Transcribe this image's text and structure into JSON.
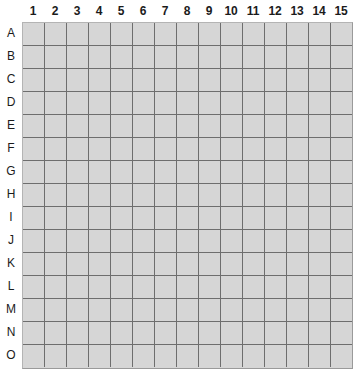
{
  "grid": {
    "title": "",
    "column_headers": [
      "1",
      "2",
      "3",
      "4",
      "5",
      "6",
      "7",
      "8",
      "9",
      "10",
      "11",
      "12",
      "13",
      "14",
      "15"
    ],
    "row_headers": [
      "A",
      "B",
      "C",
      "D",
      "E",
      "F",
      "G",
      "H",
      "I",
      "J",
      "K",
      "L",
      "M",
      "N",
      "O"
    ],
    "columns": 15,
    "rows": 15,
    "cell_values": [
      [
        "",
        "",
        "",
        "",
        "",
        "",
        "",
        "",
        "",
        "",
        "",
        "",
        "",
        "",
        ""
      ],
      [
        "",
        "",
        "",
        "",
        "",
        "",
        "",
        "",
        "",
        "",
        "",
        "",
        "",
        "",
        ""
      ],
      [
        "",
        "",
        "",
        "",
        "",
        "",
        "",
        "",
        "",
        "",
        "",
        "",
        "",
        "",
        ""
      ],
      [
        "",
        "",
        "",
        "",
        "",
        "",
        "",
        "",
        "",
        "",
        "",
        "",
        "",
        "",
        ""
      ],
      [
        "",
        "",
        "",
        "",
        "",
        "",
        "",
        "",
        "",
        "",
        "",
        "",
        "",
        "",
        ""
      ],
      [
        "",
        "",
        "",
        "",
        "",
        "",
        "",
        "",
        "",
        "",
        "",
        "",
        "",
        "",
        ""
      ],
      [
        "",
        "",
        "",
        "",
        "",
        "",
        "",
        "",
        "",
        "",
        "",
        "",
        "",
        "",
        ""
      ],
      [
        "",
        "",
        "",
        "",
        "",
        "",
        "",
        "",
        "",
        "",
        "",
        "",
        "",
        "",
        ""
      ],
      [
        "",
        "",
        "",
        "",
        "",
        "",
        "",
        "",
        "",
        "",
        "",
        "",
        "",
        "",
        ""
      ],
      [
        "",
        "",
        "",
        "",
        "",
        "",
        "",
        "",
        "",
        "",
        "",
        "",
        "",
        "",
        ""
      ],
      [
        "",
        "",
        "",
        "",
        "",
        "",
        "",
        "",
        "",
        "",
        "",
        "",
        "",
        "",
        ""
      ],
      [
        "",
        "",
        "",
        "",
        "",
        "",
        "",
        "",
        "",
        "",
        "",
        "",
        "",
        "",
        ""
      ],
      [
        "",
        "",
        "",
        "",
        "",
        "",
        "",
        "",
        "",
        "",
        "",
        "",
        "",
        "",
        ""
      ],
      [
        "",
        "",
        "",
        "",
        "",
        "",
        "",
        "",
        "",
        "",
        "",
        "",
        "",
        "",
        ""
      ],
      [
        "",
        "",
        "",
        "",
        "",
        "",
        "",
        "",
        "",
        "",
        "",
        "",
        "",
        "",
        ""
      ]
    ],
    "colors": {
      "cell_fill": "#d6d6d6",
      "gridline": "#6e6e6e",
      "outer_border": "#9a9a9a",
      "label_text": "#1b1b1b",
      "background": "#ffffff"
    }
  }
}
